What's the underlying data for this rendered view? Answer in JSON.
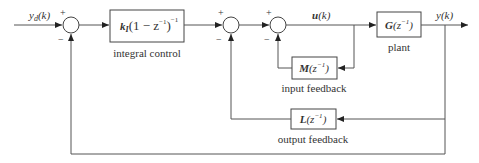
{
  "diagram": {
    "type": "control-block-diagram",
    "signals": {
      "reference": "y_d(k)",
      "control_input": "u(k)",
      "output": "y(k)"
    },
    "blocks": {
      "integral": {
        "expr_gain": "k",
        "expr_sub": "I",
        "expr_body": "(1 − z",
        "expr_exp_inner": "−1",
        "expr_close": ")",
        "expr_exp_outer": "−1",
        "label": "integral control"
      },
      "plant": {
        "name": "G",
        "arg": "(z",
        "exp": "−1",
        "close": ")",
        "label": "plant"
      },
      "input_feedback": {
        "name": "M",
        "arg": "(z",
        "exp": "−1",
        "close": ")",
        "label": "input feedback"
      },
      "output_feedback": {
        "name": "L",
        "arg": "(z",
        "exp": "−1",
        "close": ")",
        "label": "output feedback"
      }
    },
    "signs": {
      "plus": "+",
      "minus": "−"
    },
    "ref_label": {
      "base": "y",
      "sub": "d",
      "arg": "(k)"
    },
    "u_label": {
      "base": "u",
      "arg": "(k)"
    },
    "y_label": {
      "base": "y",
      "arg": "(k)"
    }
  }
}
